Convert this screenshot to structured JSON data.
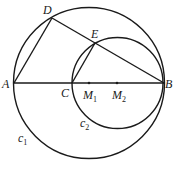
{
  "diagram": {
    "stroke_color": "#1a1a1a",
    "background": "#ffffff",
    "circles": [
      {
        "id": "c1",
        "label": "c",
        "sub": "1",
        "cx": 89,
        "cy": 83,
        "r": 75.5
      },
      {
        "id": "c2",
        "label": "c",
        "sub": "2",
        "cx": 117,
        "cy": 83,
        "r": 45.5
      }
    ],
    "points": {
      "A": {
        "label": "A",
        "x": 14,
        "y": 83
      },
      "B": {
        "label": "B",
        "x": 163,
        "y": 83
      },
      "C": {
        "label": "C",
        "x": 72,
        "y": 83
      },
      "D": {
        "label": "D",
        "x": 52,
        "y": 18
      },
      "E": {
        "label": "E",
        "x": 95,
        "y": 43
      },
      "M1": {
        "label": "M",
        "sub": "1",
        "x": 89,
        "y": 83
      },
      "M2": {
        "label": "M",
        "sub": "2",
        "x": 117,
        "y": 83
      }
    },
    "segments": [
      [
        "A",
        "B"
      ],
      [
        "A",
        "D"
      ],
      [
        "D",
        "B"
      ],
      [
        "C",
        "E"
      ]
    ]
  }
}
